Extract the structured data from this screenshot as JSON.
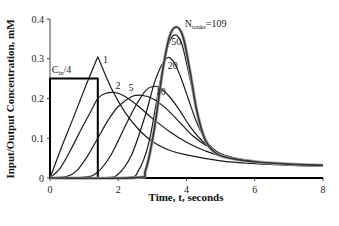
{
  "chart_data": {
    "type": "line",
    "title": "",
    "xlabel": "Time, t, seconds",
    "ylabel": "Input/Output Concentration, mM",
    "xlim": [
      0,
      8
    ],
    "ylim": [
      0,
      0.4
    ],
    "x_ticks": [
      "0",
      "2",
      "4",
      "6",
      "8"
    ],
    "y_ticks": [
      "0",
      "0.1",
      "0.2",
      "0.3",
      "0.4"
    ],
    "grid": false,
    "legend": "inline annotations",
    "input_label": "C",
    "input_label_sub": "in",
    "input_label_suffix": "/4",
    "nstages_label": "N",
    "nstages_sub": "tanks",
    "nstages_suffix": "=109",
    "series": [
      {
        "name": "Cin/4",
        "kind": "input",
        "points": [
          [
            0,
            0
          ],
          [
            0,
            0.25
          ],
          [
            1.4,
            0.25
          ],
          [
            1.4,
            0
          ],
          [
            8,
            0
          ]
        ]
      },
      {
        "name": "1",
        "label": "1",
        "points": [
          [
            0,
            0
          ],
          [
            0.35,
            0.08
          ],
          [
            0.7,
            0.155
          ],
          [
            1.05,
            0.232
          ],
          [
            1.4,
            0.305
          ],
          [
            1.8,
            0.225
          ],
          [
            2.2,
            0.165
          ],
          [
            2.6,
            0.122
          ],
          [
            3,
            0.092
          ],
          [
            3.5,
            0.07
          ],
          [
            4,
            0.058
          ],
          [
            5,
            0.043
          ],
          [
            6,
            0.036
          ],
          [
            7,
            0.032
          ],
          [
            8,
            0.03
          ]
        ]
      },
      {
        "name": "2",
        "label": "2",
        "points": [
          [
            0,
            0
          ],
          [
            0.3,
            0.025
          ],
          [
            0.6,
            0.07
          ],
          [
            0.9,
            0.12
          ],
          [
            1.2,
            0.168
          ],
          [
            1.4,
            0.2
          ],
          [
            1.6,
            0.212
          ],
          [
            1.9,
            0.215
          ],
          [
            2.2,
            0.205
          ],
          [
            2.6,
            0.18
          ],
          [
            3,
            0.15
          ],
          [
            3.5,
            0.117
          ],
          [
            4,
            0.09
          ],
          [
            4.5,
            0.07
          ],
          [
            5,
            0.056
          ],
          [
            6,
            0.042
          ],
          [
            7,
            0.035
          ],
          [
            8,
            0.031
          ]
        ]
      },
      {
        "name": "5",
        "label": "5",
        "points": [
          [
            0,
            0
          ],
          [
            0.5,
            0.004
          ],
          [
            0.8,
            0.02
          ],
          [
            1.1,
            0.055
          ],
          [
            1.4,
            0.1
          ],
          [
            1.7,
            0.145
          ],
          [
            2,
            0.18
          ],
          [
            2.4,
            0.205
          ],
          [
            2.7,
            0.208
          ],
          [
            3,
            0.2
          ],
          [
            3.4,
            0.175
          ],
          [
            3.8,
            0.14
          ],
          [
            4.2,
            0.105
          ],
          [
            4.7,
            0.075
          ],
          [
            5.2,
            0.055
          ],
          [
            6,
            0.042
          ],
          [
            7,
            0.034
          ],
          [
            8,
            0.031
          ]
        ]
      },
      {
        "name": "10",
        "label": "10",
        "points": [
          [
            0,
            0
          ],
          [
            1,
            0.002
          ],
          [
            1.4,
            0.015
          ],
          [
            1.8,
            0.06
          ],
          [
            2.2,
            0.13
          ],
          [
            2.5,
            0.18
          ],
          [
            2.8,
            0.22
          ],
          [
            3,
            0.23
          ],
          [
            3.2,
            0.228
          ],
          [
            3.5,
            0.205
          ],
          [
            3.8,
            0.17
          ],
          [
            4.1,
            0.13
          ],
          [
            4.5,
            0.09
          ],
          [
            5,
            0.06
          ],
          [
            5.5,
            0.047
          ],
          [
            6,
            0.04
          ],
          [
            7,
            0.033
          ],
          [
            8,
            0.03
          ]
        ]
      },
      {
        "name": "20",
        "label": "20",
        "points": [
          [
            0,
            0
          ],
          [
            1.6,
            0.001
          ],
          [
            2,
            0.01
          ],
          [
            2.4,
            0.06
          ],
          [
            2.8,
            0.16
          ],
          [
            3.1,
            0.25
          ],
          [
            3.4,
            0.3
          ],
          [
            3.6,
            0.295
          ],
          [
            3.8,
            0.26
          ],
          [
            4.05,
            0.2
          ],
          [
            4.3,
            0.14
          ],
          [
            4.6,
            0.09
          ],
          [
            5,
            0.06
          ],
          [
            5.5,
            0.047
          ],
          [
            6,
            0.04
          ],
          [
            7,
            0.034
          ],
          [
            8,
            0.031
          ]
        ]
      },
      {
        "name": "50",
        "label": "50",
        "points": [
          [
            0,
            0
          ],
          [
            2.2,
            0.001
          ],
          [
            2.6,
            0.02
          ],
          [
            2.9,
            0.09
          ],
          [
            3.2,
            0.23
          ],
          [
            3.45,
            0.33
          ],
          [
            3.65,
            0.36
          ],
          [
            3.85,
            0.34
          ],
          [
            4.05,
            0.27
          ],
          [
            4.3,
            0.17
          ],
          [
            4.55,
            0.1
          ],
          [
            4.9,
            0.062
          ],
          [
            5.4,
            0.048
          ],
          [
            6,
            0.04
          ],
          [
            7,
            0.034
          ],
          [
            8,
            0.031
          ]
        ]
      },
      {
        "name": "109",
        "label": "Ntanks=109",
        "points": [
          [
            0,
            0
          ],
          [
            2.5,
            0.001
          ],
          [
            2.8,
            0.02
          ],
          [
            3.05,
            0.12
          ],
          [
            3.3,
            0.27
          ],
          [
            3.5,
            0.355
          ],
          [
            3.7,
            0.38
          ],
          [
            3.9,
            0.355
          ],
          [
            4.1,
            0.27
          ],
          [
            4.3,
            0.17
          ],
          [
            4.55,
            0.095
          ],
          [
            4.9,
            0.06
          ],
          [
            5.4,
            0.048
          ],
          [
            6,
            0.041
          ],
          [
            7,
            0.035
          ],
          [
            8,
            0.032
          ]
        ]
      }
    ],
    "annotations": [
      {
        "text": "1",
        "x": 1.55,
        "y": 0.29
      },
      {
        "text": "2",
        "x": 1.92,
        "y": 0.225
      },
      {
        "text": "5",
        "x": 2.3,
        "y": 0.22
      },
      {
        "text": "10",
        "x": 3.1,
        "y": 0.21
      },
      {
        "text": "20",
        "x": 3.45,
        "y": 0.275
      },
      {
        "text": "50",
        "x": 3.55,
        "y": 0.335
      },
      {
        "text": "Ntanks=109",
        "x": 3.95,
        "y": 0.38
      },
      {
        "text": "Cin/4",
        "x": 0.05,
        "y": 0.265
      }
    ]
  }
}
